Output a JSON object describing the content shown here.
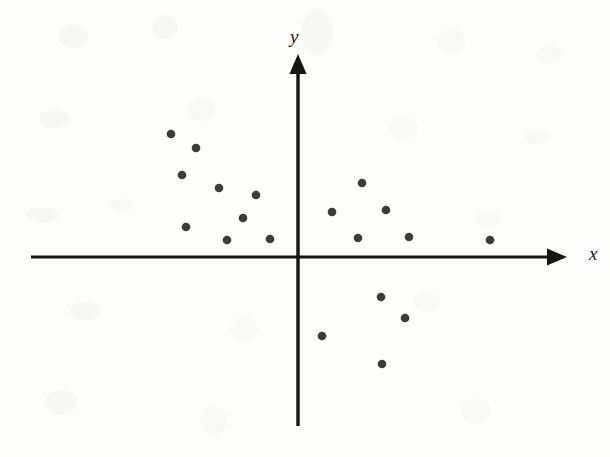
{
  "figure": {
    "background_color": "#fdfdfc",
    "ink_color": "#121212",
    "point_color": "#3b3b3b",
    "axis_x_label": "x",
    "axis_y_label": "y"
  },
  "chart_data": {
    "type": "scatter",
    "title": "",
    "subtitle": "",
    "xlabel": "x",
    "ylabel": "y",
    "grid": false,
    "legend": null,
    "axes_style": "arrow-terminated cartesian axes crossing at origin, no tick marks, no numeric tick labels",
    "xlim": [
      -10,
      10
    ],
    "ylim": [
      -7,
      7
    ],
    "x_tick_labels": [],
    "y_tick_labels": [],
    "annotations": [],
    "series": [
      {
        "name": "observations",
        "marker": "filled-circle",
        "color": "#3b3b3b",
        "n_points": 19,
        "points_pixel": [
          {
            "px": 171,
            "py": 134
          },
          {
            "px": 196,
            "py": 148
          },
          {
            "px": 182,
            "py": 175
          },
          {
            "px": 219,
            "py": 188
          },
          {
            "px": 256,
            "py": 195
          },
          {
            "px": 243,
            "py": 218
          },
          {
            "px": 186,
            "py": 227
          },
          {
            "px": 227,
            "py": 240
          },
          {
            "px": 270,
            "py": 239
          },
          {
            "px": 332,
            "py": 212
          },
          {
            "px": 362,
            "py": 183
          },
          {
            "px": 386,
            "py": 210
          },
          {
            "px": 358,
            "py": 238
          },
          {
            "px": 409,
            "py": 237
          },
          {
            "px": 490,
            "py": 240
          },
          {
            "px": 381,
            "py": 297
          },
          {
            "px": 405,
            "py": 318
          },
          {
            "px": 322,
            "py": 336
          },
          {
            "px": 382,
            "py": 364
          }
        ],
        "x": [
          -4.7,
          -3.7,
          -4.2,
          -2.9,
          -1.5,
          -2.0,
          -4.0,
          -2.6,
          -1.0,
          1.2,
          2.3,
          3.2,
          2.2,
          4.0,
          7.0,
          3.0,
          3.9,
          0.8,
          3.1
        ],
        "y": [
          5.1,
          4.5,
          3.4,
          2.9,
          2.6,
          1.7,
          1.3,
          0.7,
          0.8,
          1.9,
          3.1,
          2.0,
          0.8,
          0.9,
          0.7,
          -1.8,
          -2.7,
          -3.4,
          -4.6
        ]
      }
    ]
  },
  "geometry": {
    "x_axis": {
      "x1": 31,
      "y1": 257,
      "x2": 566,
      "y2": 257,
      "arrow": "end-right"
    },
    "y_axis": {
      "x1": 298,
      "y1": 426,
      "x2": 298,
      "y2": 55,
      "arrow": "end-up"
    },
    "origin": {
      "x": 298,
      "y": 257
    },
    "marker_radius": 4.3,
    "axis_stroke_width": 3
  },
  "labels": {
    "y_label_pos": {
      "x": 290,
      "y": 27
    },
    "x_label_pos": {
      "x": 589,
      "y": 244
    }
  }
}
